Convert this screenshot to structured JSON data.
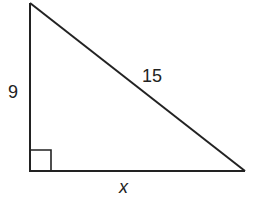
{
  "figure": {
    "type": "right-triangle",
    "stroke_color": "#222222",
    "background": "#ffffff",
    "vertices": {
      "top": [
        30,
        3
      ],
      "right_angle": [
        30,
        171
      ],
      "right": [
        245,
        171
      ]
    },
    "right_angle_marker": true,
    "labels": {
      "vertical_leg": "9",
      "hypotenuse": "15",
      "horizontal_leg": "x"
    }
  }
}
